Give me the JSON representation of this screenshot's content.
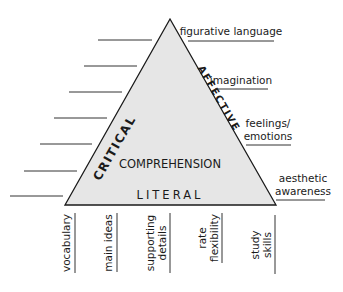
{
  "diagram": {
    "triangle": {
      "fill": "#e6e6e6",
      "stroke": "#1a1a1a",
      "apex": [
        170,
        19
      ],
      "base_left": [
        65,
        205
      ],
      "base_right": [
        276,
        205
      ]
    },
    "inner_labels": {
      "left_side": "CRITICAL",
      "right_side": "AFFECTIVE",
      "center": "COMPREHENSION",
      "base": "LITERAL"
    },
    "right_labels": [
      {
        "lines": [
          "figurative language"
        ]
      },
      {
        "lines": [
          "imagination"
        ]
      },
      {
        "lines": [
          "feelings/",
          "emotions"
        ]
      },
      {
        "lines": [
          "aesthetic",
          "awareness"
        ]
      }
    ],
    "bottom_labels": [
      {
        "lines": [
          "vocabulary"
        ]
      },
      {
        "lines": [
          "main ideas"
        ]
      },
      {
        "lines": [
          "supporting",
          "details"
        ]
      },
      {
        "lines": [
          "rate",
          "flexibility"
        ]
      },
      {
        "lines": [
          "study",
          "skills"
        ]
      }
    ],
    "left_blank_lines_count": 7
  }
}
